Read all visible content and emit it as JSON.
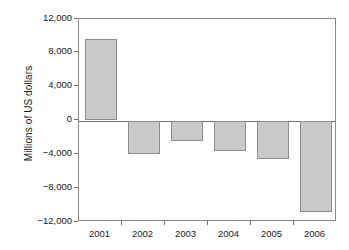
{
  "chart_data": {
    "type": "bar",
    "title": "",
    "xlabel": "",
    "ylabel": "Millions of US dollars",
    "categories": [
      "2001",
      "2002",
      "2003",
      "2004",
      "2005",
      "2006"
    ],
    "values": [
      9600,
      -3950,
      -2450,
      -3600,
      -4500,
      -10800
    ],
    "ylim": [
      -12000,
      12000
    ],
    "yticks": [
      12000,
      8000,
      4000,
      0,
      -4000,
      -8000,
      -12000
    ],
    "ytick_labels": [
      "12,000",
      "8,000",
      "4,000",
      "0",
      "−4,000",
      "−8,000",
      "−12,000"
    ],
    "grid": false,
    "legend": null,
    "series": [
      {
        "name": "Millions of US dollars",
        "values": [
          9600,
          -3950,
          -2450,
          -3600,
          -4500,
          -10800
        ]
      }
    ],
    "bar_fill_color": "#c9c9c9",
    "bar_border_color": "#8d8d8d",
    "axis_color": "#8a8a8a",
    "text_color": "#1a1a1a"
  }
}
